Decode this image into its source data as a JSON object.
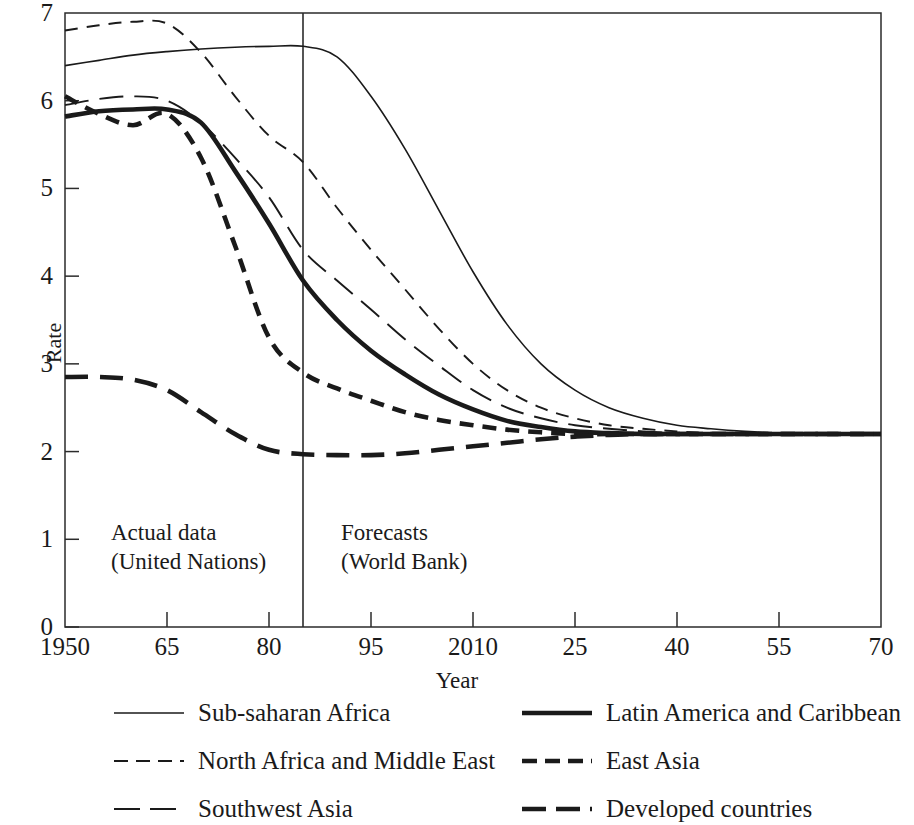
{
  "chart_data": {
    "type": "line",
    "title": "",
    "xlabel": "Year",
    "ylabel": "Rate",
    "xlim": [
      1950,
      2070
    ],
    "ylim": [
      0,
      7
    ],
    "grid": false,
    "legend_position": "below",
    "x_ticks": [
      "1950",
      "65",
      "80",
      "95",
      "2010",
      "25",
      "40",
      "55",
      "70"
    ],
    "x_tick_values": [
      1950,
      1965,
      1980,
      1995,
      2010,
      2025,
      2040,
      2055,
      2070
    ],
    "y_ticks": [
      "0",
      "1",
      "2",
      "3",
      "4",
      "5",
      "6",
      "7"
    ],
    "y_tick_values": [
      0,
      1,
      2,
      3,
      4,
      5,
      6,
      7
    ],
    "annotations": [
      {
        "name": "actual-data",
        "line1": "Actual data",
        "line2": "(United Nations)",
        "x_range": [
          1950,
          1985
        ]
      },
      {
        "name": "forecasts",
        "line1": "Forecasts",
        "line2": "(World Bank)",
        "x_range": [
          1985,
          2070
        ]
      }
    ],
    "divider": {
      "label": "forecast-boundary",
      "x_value": 1985
    },
    "series": [
      {
        "name": "Sub-saharan Africa",
        "style": "solid-thin",
        "x": [
          1950,
          1955,
          1960,
          1965,
          1970,
          1975,
          1980,
          1985,
          1990,
          1995,
          2000,
          2005,
          2010,
          2015,
          2020,
          2025,
          2030,
          2035,
          2040,
          2045,
          2050,
          2055,
          2060,
          2065,
          2070
        ],
        "y": [
          6.4,
          6.46,
          6.52,
          6.56,
          6.59,
          6.61,
          6.62,
          6.62,
          6.5,
          6.05,
          5.45,
          4.75,
          4.05,
          3.45,
          3.0,
          2.7,
          2.5,
          2.38,
          2.3,
          2.26,
          2.23,
          2.21,
          2.2,
          2.2,
          2.2
        ]
      },
      {
        "name": "North Africa and Middle East",
        "style": "dashed-thin-short",
        "x": [
          1950,
          1955,
          1960,
          1965,
          1970,
          1975,
          1980,
          1985,
          1990,
          1995,
          2000,
          2005,
          2010,
          2015,
          2020,
          2025,
          2030,
          2035,
          2040,
          2045,
          2050,
          2055,
          2060,
          2065,
          2070
        ],
        "y": [
          6.8,
          6.86,
          6.9,
          6.88,
          6.55,
          6.05,
          5.6,
          5.3,
          4.78,
          4.3,
          3.85,
          3.4,
          3.0,
          2.7,
          2.5,
          2.38,
          2.3,
          2.26,
          2.23,
          2.21,
          2.2,
          2.2,
          2.2,
          2.2,
          2.2
        ]
      },
      {
        "name": "Southwest Asia",
        "style": "dashed-thin-long",
        "x": [
          1950,
          1955,
          1960,
          1965,
          1970,
          1975,
          1980,
          1985,
          1990,
          1995,
          2000,
          2005,
          2010,
          2015,
          2020,
          2025,
          2030,
          2035,
          2040,
          2045,
          2050,
          2055,
          2060,
          2065,
          2070
        ],
        "y": [
          5.95,
          6.02,
          6.05,
          6.0,
          5.75,
          5.35,
          4.9,
          4.3,
          3.95,
          3.62,
          3.28,
          2.98,
          2.7,
          2.5,
          2.38,
          2.3,
          2.26,
          2.23,
          2.21,
          2.2,
          2.2,
          2.2,
          2.2,
          2.2,
          2.2
        ]
      },
      {
        "name": "Latin America and Caribbean",
        "style": "solid-thick",
        "x": [
          1950,
          1955,
          1960,
          1965,
          1970,
          1975,
          1980,
          1985,
          1990,
          1995,
          2000,
          2005,
          2010,
          2015,
          2020,
          2025,
          2030,
          2035,
          2040,
          2045,
          2050,
          2055,
          2060,
          2065,
          2070
        ],
        "y": [
          5.82,
          5.88,
          5.9,
          5.9,
          5.75,
          5.2,
          4.6,
          3.95,
          3.5,
          3.15,
          2.88,
          2.65,
          2.48,
          2.35,
          2.28,
          2.23,
          2.21,
          2.2,
          2.2,
          2.2,
          2.2,
          2.2,
          2.2,
          2.2,
          2.2
        ]
      },
      {
        "name": "East Asia",
        "style": "dashed-thick-short",
        "x": [
          1950,
          1955,
          1960,
          1965,
          1970,
          1975,
          1980,
          1985,
          1990,
          1995,
          2000,
          2005,
          2010,
          2015,
          2020,
          2025,
          2030,
          2035,
          2040,
          2045,
          2050,
          2055,
          2060,
          2065,
          2070
        ],
        "y": [
          6.05,
          5.85,
          5.72,
          5.85,
          5.35,
          4.35,
          3.3,
          2.9,
          2.72,
          2.58,
          2.45,
          2.36,
          2.3,
          2.25,
          2.22,
          2.2,
          2.2,
          2.2,
          2.2,
          2.2,
          2.2,
          2.2,
          2.2,
          2.2,
          2.2
        ]
      },
      {
        "name": "Developed countries",
        "style": "dashed-thick-long",
        "x": [
          1950,
          1955,
          1960,
          1965,
          1970,
          1975,
          1980,
          1985,
          1990,
          1995,
          2000,
          2005,
          2010,
          2015,
          2020,
          2025,
          2030,
          2035,
          2040,
          2045,
          2050,
          2055,
          2060,
          2065,
          2070
        ],
        "y": [
          2.85,
          2.85,
          2.82,
          2.7,
          2.45,
          2.2,
          2.02,
          1.97,
          1.96,
          1.96,
          1.98,
          2.02,
          2.06,
          2.1,
          2.14,
          2.17,
          2.19,
          2.2,
          2.2,
          2.2,
          2.2,
          2.2,
          2.2,
          2.2,
          2.2
        ]
      }
    ]
  },
  "axes": {
    "y_label": "Rate",
    "x_label": "Year"
  },
  "legend": [
    {
      "label": "Sub-saharan Africa",
      "style": "solid-thin"
    },
    {
      "label": "North Africa and Middle East",
      "style": "dashed-thin-short"
    },
    {
      "label": "Southwest Asia",
      "style": "dashed-thin-long"
    },
    {
      "label": "Latin America and Caribbean",
      "style": "solid-thick"
    },
    {
      "label": "East Asia",
      "style": "dashed-thick-short"
    },
    {
      "label": "Developed countries",
      "style": "dashed-thick-long"
    }
  ],
  "colors": {
    "ink": "#1a1a1a",
    "axis": "#2b2b2b",
    "background": "#ffffff"
  }
}
